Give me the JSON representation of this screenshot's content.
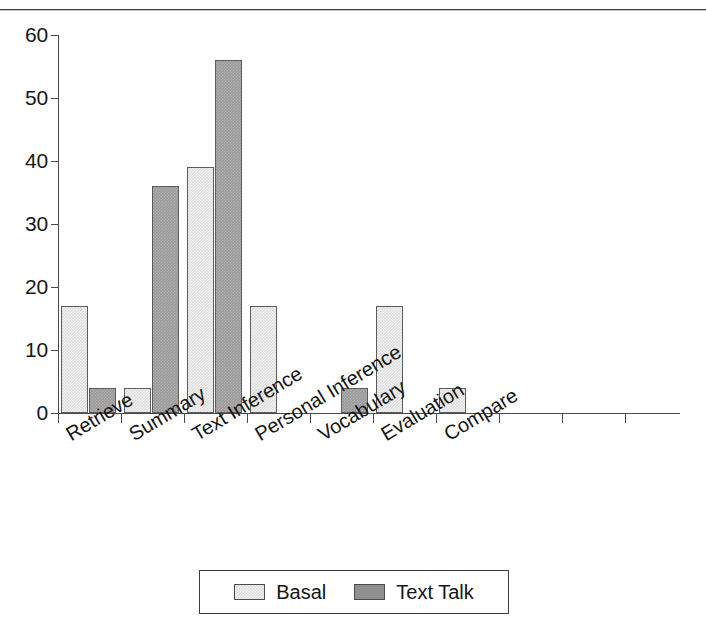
{
  "page": {
    "clipped_header_text": "",
    "top_rule": "horizontal-rule"
  },
  "legend": {
    "position": "bottom-center",
    "entries": [
      {
        "label": "Basal",
        "color": "#dedede",
        "swatch": "basal-swatch"
      },
      {
        "label": "Text Talk",
        "color": "#9a9a9a",
        "swatch": "text-talk-swatch"
      }
    ]
  },
  "axis": {
    "y_ticks": [
      "0",
      "10",
      "20",
      "30",
      "40",
      "50",
      "60"
    ]
  },
  "chart_data": {
    "type": "bar",
    "title": "",
    "subtitle": "",
    "xlabel": "",
    "ylabel": "",
    "ylim": [
      0,
      60
    ],
    "ytick_interval": 10,
    "grid": false,
    "legend_position": "bottom-center",
    "categories": [
      "Retrieve",
      "Summary",
      "Text Inference",
      "Personal Inference",
      "Vocabulary",
      "Evaluation",
      "Compare"
    ],
    "series": [
      {
        "name": "Basal",
        "color": "#dedede",
        "values": [
          17,
          4,
          39,
          17,
          0,
          17,
          4
        ]
      },
      {
        "name": "Text Talk",
        "color": "#9a9a9a",
        "values": [
          4,
          36,
          56,
          0,
          4,
          0,
          0
        ]
      }
    ]
  }
}
